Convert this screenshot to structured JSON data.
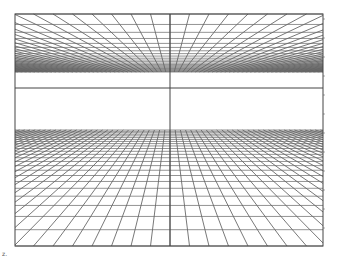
{
  "figure": {
    "frame": {
      "left": 15,
      "top": 14,
      "right": 323,
      "bottom": 246
    },
    "vanishing_point": {
      "x": 170,
      "y": 88
    },
    "horizon_line_y": 88,
    "center_vertical_x": 170,
    "ceiling": {
      "top": 14,
      "bottom": 72,
      "radial_spacing": 19.5,
      "rows": 22
    },
    "floor": {
      "top": 130,
      "bottom": 246,
      "radial_spacing": 19.5,
      "rows": 24
    },
    "right_ticks_spacing": 19,
    "line_color": "#555555",
    "corner_label": "z."
  }
}
